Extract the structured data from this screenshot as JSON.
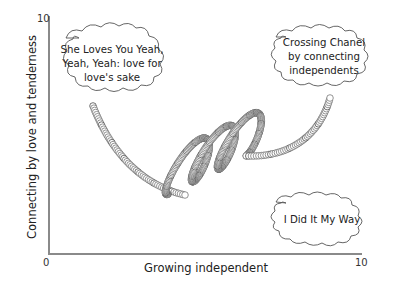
{
  "diagram": {
    "y_axis": {
      "title": "Connecting by love and tenderness",
      "max_label": "10"
    },
    "x_axis": {
      "title": "Growing independent",
      "min_label": "0",
      "max_label": "10"
    },
    "clouds": [
      {
        "id": "she-loves-you",
        "lines": [
          "She Loves You Yeah,",
          "Yeah, Yeah: love for",
          "love's sake"
        ]
      },
      {
        "id": "crossing-chanel",
        "lines": [
          "Crossing Chanel",
          "by connecting",
          "independents"
        ]
      },
      {
        "id": "i-did-it-my-way",
        "lines": [
          "I Did It My Way"
        ]
      }
    ],
    "spiral": {
      "description": "coiled spring path from upper-left to upper-right with three loops",
      "loops": 3,
      "stroke_color": "#555555"
    }
  }
}
